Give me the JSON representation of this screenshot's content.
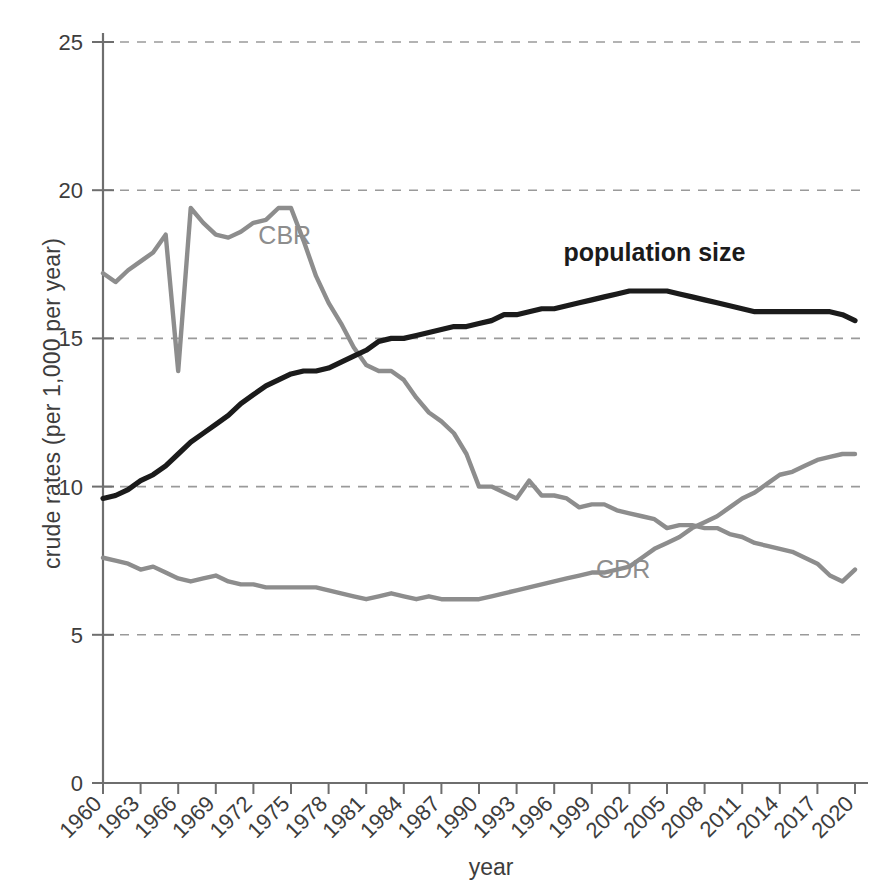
{
  "chart_data": {
    "type": "line",
    "title": "",
    "xlabel": "year",
    "ylabel": "crude rates (per 1,000 per year)",
    "xlim": [
      1960,
      2020
    ],
    "ylim": [
      0,
      25
    ],
    "yticks": [
      "0",
      "5",
      "10",
      "15",
      "20",
      "25"
    ],
    "ytick_values": [
      0,
      5,
      10,
      15,
      20,
      25
    ],
    "grid": "horizontal dashed at 5,10,15,20,25",
    "legend": "inline series labels on plot",
    "xticks": [
      "1960",
      "1963",
      "1966",
      "1969",
      "1972",
      "1975",
      "1978",
      "1981",
      "1984",
      "1987",
      "1990",
      "1993",
      "1996",
      "1999",
      "2002",
      "2005",
      "2008",
      "2011",
      "2014",
      "2017",
      "2020"
    ],
    "xtick_rotation": -45,
    "x": [
      1960,
      1961,
      1962,
      1963,
      1964,
      1965,
      1966,
      1967,
      1968,
      1969,
      1970,
      1971,
      1972,
      1973,
      1974,
      1975,
      1976,
      1977,
      1978,
      1979,
      1980,
      1981,
      1982,
      1983,
      1984,
      1985,
      1986,
      1987,
      1988,
      1989,
      1990,
      1991,
      1992,
      1993,
      1994,
      1995,
      1996,
      1997,
      1998,
      1999,
      2000,
      2001,
      2002,
      2003,
      2004,
      2005,
      2006,
      2007,
      2008,
      2009,
      2010,
      2011,
      2012,
      2013,
      2014,
      2015,
      2016,
      2017,
      2018,
      2019,
      2020
    ],
    "series": [
      {
        "name": "CBR",
        "label": "CBR",
        "color": "#8d8d8d",
        "label_x": 1974.5,
        "label_y": 18.2,
        "values": [
          17.2,
          16.9,
          17.3,
          17.6,
          17.9,
          18.5,
          13.9,
          19.4,
          18.9,
          18.5,
          18.4,
          18.6,
          18.9,
          19.0,
          19.4,
          19.4,
          18.3,
          17.1,
          16.2,
          15.5,
          14.7,
          14.1,
          13.9,
          13.9,
          13.6,
          13.0,
          12.5,
          12.2,
          11.8,
          11.1,
          10.0,
          10.0,
          9.8,
          9.6,
          10.2,
          9.7,
          9.7,
          9.6,
          9.3,
          9.4,
          9.4,
          9.2,
          9.1,
          9.0,
          8.9,
          8.6,
          8.7,
          8.7,
          8.6,
          8.6,
          8.4,
          8.3,
          8.1,
          8.0,
          7.9,
          7.8,
          7.6,
          7.4,
          7.0,
          6.8,
          7.2
        ]
      },
      {
        "name": "CDR",
        "label": "CDR",
        "color": "#8d8d8d",
        "label_x": 2001.5,
        "label_y": 6.9,
        "values": [
          7.6,
          7.5,
          7.4,
          7.2,
          7.3,
          7.1,
          6.9,
          6.8,
          6.9,
          7.0,
          6.8,
          6.7,
          6.7,
          6.6,
          6.6,
          6.6,
          6.6,
          6.6,
          6.5,
          6.4,
          6.3,
          6.2,
          6.3,
          6.4,
          6.3,
          6.2,
          6.3,
          6.2,
          6.2,
          6.2,
          6.2,
          6.3,
          6.4,
          6.5,
          6.6,
          6.7,
          6.8,
          6.9,
          7.0,
          7.1,
          7.1,
          7.2,
          7.3,
          7.6,
          7.9,
          8.1,
          8.3,
          8.6,
          8.8,
          9.0,
          9.3,
          9.6,
          9.8,
          10.1,
          10.4,
          10.5,
          10.7,
          10.9,
          11.0,
          11.1,
          11.1
        ]
      },
      {
        "name": "population size",
        "label": "population size",
        "color": "#1b1b1b",
        "label_x": 2004,
        "label_y": 17.6,
        "values": [
          9.6,
          9.7,
          9.9,
          10.2,
          10.4,
          10.7,
          11.1,
          11.5,
          11.8,
          12.1,
          12.4,
          12.8,
          13.1,
          13.4,
          13.6,
          13.8,
          13.9,
          13.9,
          14.0,
          14.2,
          14.4,
          14.6,
          14.9,
          15.0,
          15.0,
          15.1,
          15.2,
          15.3,
          15.4,
          15.4,
          15.5,
          15.6,
          15.8,
          15.8,
          15.9,
          16.0,
          16.0,
          16.1,
          16.2,
          16.3,
          16.4,
          16.5,
          16.6,
          16.6,
          16.6,
          16.6,
          16.5,
          16.4,
          16.3,
          16.2,
          16.1,
          16.0,
          15.9,
          15.9,
          15.9,
          15.9,
          15.9,
          15.9,
          15.9,
          15.8,
          15.6
        ]
      }
    ]
  },
  "figure": {
    "background": "#ffffff",
    "axis_color": "#6e6e6e",
    "grid_color": "#9a9a9a",
    "text_color": "#3d3d3d"
  }
}
